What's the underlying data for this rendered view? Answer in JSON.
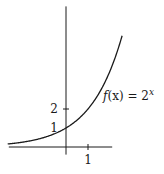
{
  "chart_data": {
    "type": "line",
    "title": "",
    "xlabel": "",
    "ylabel": "",
    "function": "2^x",
    "annotation": {
      "prefix": "f",
      "arg": "(x) = 2",
      "exp": "x"
    },
    "xlim": [
      -2.6,
      2.1
    ],
    "ylim": [
      -0.4,
      7.4
    ],
    "curve_domain": [
      -2.65,
      2.55
    ],
    "x_ticks": [
      {
        "value": 1,
        "label": "1"
      }
    ],
    "y_ticks": [
      {
        "value": 1,
        "label": "1",
        "tick": false
      },
      {
        "value": 2,
        "label": "2",
        "tick": true
      }
    ],
    "series": [
      {
        "name": "f(x) = 2^x",
        "expression": "2^x"
      }
    ],
    "grid": false,
    "legend": "none"
  }
}
